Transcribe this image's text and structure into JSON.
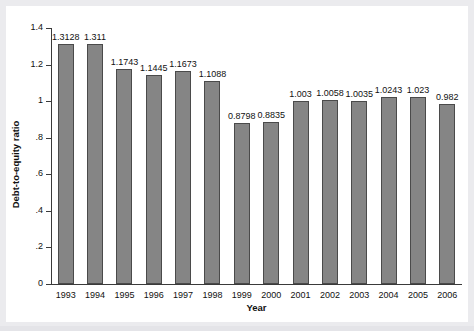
{
  "chart_data": {
    "type": "bar",
    "title": "",
    "xlabel": "Year",
    "ylabel": "Debt-to-equity ratio",
    "categories": [
      "1993",
      "1994",
      "1995",
      "1996",
      "1997",
      "1998",
      "1999",
      "2000",
      "2001",
      "2002",
      "2003",
      "2004",
      "2005",
      "2006"
    ],
    "values": [
      1.3128,
      1.311,
      1.1743,
      1.1445,
      1.1673,
      1.1088,
      0.8798,
      0.8835,
      1.003,
      1.0058,
      1.0035,
      1.0243,
      1.023,
      0.982
    ],
    "value_labels": [
      "1.3128",
      "1.311",
      "1.1743",
      "1.1445",
      "1.1673",
      "1.1088",
      "0.8798",
      "0.8835",
      "1.003",
      "1.0058",
      "1.0035",
      "1.0243",
      "1.023",
      "0.982"
    ],
    "ylim": [
      0,
      1.4
    ],
    "ytick_values": [
      0,
      0.2,
      0.4,
      0.6,
      0.8,
      1.0,
      1.2,
      1.4
    ],
    "ytick_labels": [
      "0",
      ".2",
      ".4",
      ".6",
      ".8",
      "1",
      "1.2",
      "1.4"
    ],
    "grid": false,
    "legend": null,
    "bar_color": "#858585",
    "bar_edge_color": "#4a4a4a",
    "axis_color": "#3a3a3a",
    "background": "#ffffff",
    "page_background": "#ebebee"
  }
}
